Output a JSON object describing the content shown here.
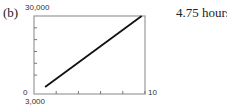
{
  "part_label": "(b)",
  "answer": "4.75 hours",
  "chart_data": {
    "type": "line",
    "title": "",
    "xlabel": "",
    "ylabel": "",
    "xlim": [
      0,
      10
    ],
    "ylim": [
      -3000,
      30000
    ],
    "x_tick_labels": {
      "max": "10"
    },
    "y_tick_labels": {
      "max": "30,000",
      "zero": "0",
      "min": "3,000"
    },
    "x_ticks": [
      2,
      4,
      6,
      8,
      10
    ],
    "y_ticks": [
      5000,
      10000,
      15000,
      20000,
      25000
    ],
    "grid": false,
    "series": [
      {
        "name": "line",
        "x": [
          1,
          9.7
        ],
        "y": [
          0,
          30000
        ],
        "color": "#111111"
      }
    ]
  }
}
